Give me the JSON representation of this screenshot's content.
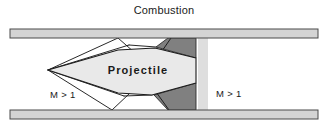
{
  "figure": {
    "kind": "ram-accelerator-schematic",
    "title": "Combustion",
    "labels": {
      "projectile": "Projectile",
      "mach_left": "M > 1",
      "mach_right": "M > 1"
    },
    "colors": {
      "background": "#ffffff",
      "tube_wall_fill": "#d4d4d4",
      "tube_wall_stroke": "#4a4a4a",
      "projectile_fill": "#e9e9e9",
      "projectile_stroke": "#1a1a1a",
      "combustion_wedge_fill": "#808080",
      "combustion_wedge_stroke": "#2b2b2b",
      "pale_band_fill": "#dedede",
      "shock_line": "#111111",
      "text": "#1a1a1a"
    },
    "geometry": {
      "canvas": {
        "width": 328,
        "height": 127
      },
      "tube_top_wall": {
        "x": 10,
        "y": 29,
        "width": 308,
        "height": 9
      },
      "tube_bottom_wall": {
        "x": 10,
        "y": 110,
        "width": 308,
        "height": 9
      },
      "duct_interior": {
        "top": 38,
        "bottom": 110
      },
      "projectile_nose": {
        "x": 48,
        "y": 70
      },
      "projectile_tail_x": 196,
      "pale_band": {
        "x": 198,
        "width": 10
      }
    },
    "shapes": {
      "projectile_body": "48,70 118,50 155,48 196,58 196,83 152,95 118,93",
      "wedge_top": "168,38 196,38 196,58 156,47",
      "wedge_bottom": "168,110 196,110 196,83 154,95",
      "pale_band": "198,38 208,38 208,110 198,110"
    },
    "shock_lines": [
      "48,70 118,38",
      "48,70 128,44",
      "118,38 151,67",
      "128,44 155,48",
      "151,67 172,38",
      "48,70 112,110",
      "48,70 124,96",
      "112,110 146,78",
      "124,96 152,95",
      "146,78 170,110"
    ]
  }
}
